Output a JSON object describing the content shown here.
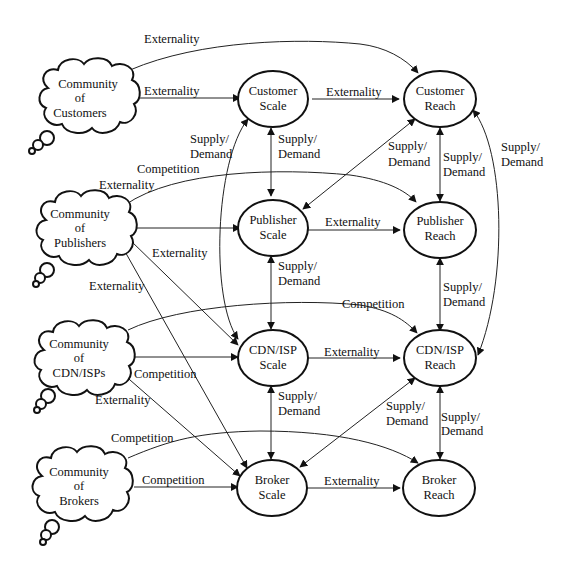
{
  "diagram": {
    "communities": [
      {
        "id": "customers",
        "lines": [
          "Community",
          "of",
          "Customers"
        ]
      },
      {
        "id": "publishers",
        "lines": [
          "Community",
          "of",
          "Publishers"
        ]
      },
      {
        "id": "cdnisps",
        "lines": [
          "Community",
          "of",
          "CDN/ISPs"
        ]
      },
      {
        "id": "brokers",
        "lines": [
          "Community",
          "of",
          "Brokers"
        ]
      }
    ],
    "nodes": {
      "customer_scale": [
        "Customer",
        "Scale"
      ],
      "customer_reach": [
        "Customer",
        "Reach"
      ],
      "publisher_scale": [
        "Publisher",
        "Scale"
      ],
      "publisher_reach": [
        "Publisher",
        "Reach"
      ],
      "cdnisp_scale": [
        "CDN/ISP",
        "Scale"
      ],
      "cdnisp_reach": [
        "CDN/ISP",
        "Reach"
      ],
      "broker_scale": [
        "Broker",
        "Scale"
      ],
      "broker_reach": [
        "Broker",
        "Reach"
      ]
    },
    "edge_labels": {
      "externality": "Externality",
      "competition": "Competition",
      "supply": "Supply/",
      "demand": "Demand"
    },
    "edges": [
      {
        "from": "Community of Customers",
        "to": "Customer Reach",
        "label": "Externality"
      },
      {
        "from": "Community of Customers",
        "to": "Customer Scale",
        "label": "Externality"
      },
      {
        "from": "Customer Scale",
        "to": "Customer Reach",
        "label": "Externality"
      },
      {
        "from": "Customer Scale",
        "to": "Publisher Scale",
        "label": "Supply/Demand",
        "bidirectional": true
      },
      {
        "from": "Customer Scale",
        "to": "CDN/ISP Scale",
        "label": "Supply/Demand",
        "bidirectional": true
      },
      {
        "from": "Customer Reach",
        "to": "Publisher Reach",
        "label": "Supply/Demand",
        "bidirectional": true
      },
      {
        "from": "Customer Reach",
        "to": "Publisher Scale",
        "label": "Supply/Demand",
        "bidirectional": true
      },
      {
        "from": "Customer Reach",
        "to": "CDN/ISP Reach",
        "label": "Supply/Demand",
        "bidirectional": true
      },
      {
        "from": "Community of Publishers",
        "to": "Publisher Reach",
        "label": "Competition"
      },
      {
        "from": "Community of Publishers",
        "to": "Customer Scale",
        "label": "Externality"
      },
      {
        "from": "Community of Publishers",
        "to": "Publisher Scale",
        "label": ""
      },
      {
        "from": "Community of Publishers",
        "to": "CDN/ISP Scale",
        "label": "Externality"
      },
      {
        "from": "Community of Publishers",
        "to": "Broker Scale",
        "label": "Externality"
      },
      {
        "from": "Publisher Scale",
        "to": "Publisher Reach",
        "label": "Externality"
      },
      {
        "from": "Publisher Scale",
        "to": "CDN/ISP Scale",
        "label": "Supply/Demand",
        "bidirectional": true
      },
      {
        "from": "Publisher Reach",
        "to": "CDN/ISP Reach",
        "label": "Supply/Demand",
        "bidirectional": true
      },
      {
        "from": "Community of CDN/ISPs",
        "to": "CDN/ISP Reach",
        "label": "Competition"
      },
      {
        "from": "Community of CDN/ISPs",
        "to": "CDN/ISP Scale",
        "label": ""
      },
      {
        "from": "Community of CDN/ISPs",
        "to": "Broker Scale",
        "label": "Externality"
      },
      {
        "from": "Community of Publishers",
        "to": "Broker Scale",
        "label": "Competition"
      },
      {
        "from": "CDN/ISP Scale",
        "to": "CDN/ISP Reach",
        "label": "Externality"
      },
      {
        "from": "CDN/ISP Scale",
        "to": "Broker Scale",
        "label": "Supply/Demand",
        "bidirectional": true
      },
      {
        "from": "CDN/ISP Reach",
        "to": "Broker Scale",
        "label": "Supply/Demand",
        "bidirectional": true
      },
      {
        "from": "CDN/ISP Reach",
        "to": "Broker Reach",
        "label": "Supply/Demand",
        "bidirectional": true
      },
      {
        "from": "Community of Brokers",
        "to": "Broker Reach",
        "label": "Competition"
      },
      {
        "from": "Community of Brokers",
        "to": "Broker Scale",
        "label": "Competition"
      },
      {
        "from": "Broker Scale",
        "to": "Broker Reach",
        "label": "Externality"
      }
    ]
  }
}
